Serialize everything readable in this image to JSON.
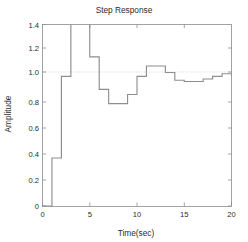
{
  "figure": {
    "title": "Step Response",
    "background_color": "#ffffff",
    "axis_color": "#8c8c8c",
    "grid_color": "#b9b9b9",
    "line_color": "#8e8e8e"
  },
  "chart_data": {
    "type": "line",
    "title": "Step Response",
    "xlabel": "Time(sec)",
    "ylabel": "Amplitude",
    "xlim": [
      0,
      20
    ],
    "ylim": [
      0,
      1.4
    ],
    "xticks": [
      0,
      5,
      10,
      15,
      20
    ],
    "xtick_labels": [
      "0",
      "5",
      "10",
      "15",
      "20"
    ],
    "yticks": [
      0,
      0.2,
      0.4,
      0.6,
      0.8,
      1.0,
      1.2,
      1.4
    ],
    "ytick_labels": [
      "0",
      "0.2",
      "0.4",
      "0.6",
      "0.8",
      "1.0",
      "1.2",
      "1.4"
    ],
    "grid": true,
    "gridlines_y": [
      1.0
    ],
    "legend": null,
    "drawstyle": "steps-post",
    "note": "Discrete-time (zero-order hold) step response; the 3-5 sec sample overshoots above the 1.4 axis limit and is clipped by the plot box.",
    "series": [
      {
        "name": "step response",
        "x": [
          0,
          1,
          2,
          3,
          4,
          5,
          6,
          7,
          8,
          9,
          10,
          11,
          12,
          13,
          14,
          15,
          16,
          17,
          18,
          19,
          20
        ],
        "values": [
          0.0,
          0.37,
          1.0,
          1.47,
          1.47,
          1.15,
          0.9,
          0.79,
          0.79,
          0.86,
          1.0,
          1.08,
          1.08,
          1.03,
          0.97,
          0.96,
          0.96,
          0.98,
          1.0,
          1.02,
          1.0
        ]
      }
    ]
  },
  "axes": {
    "x_axis_name": "time-axis",
    "y_axis_name": "amplitude-axis"
  }
}
